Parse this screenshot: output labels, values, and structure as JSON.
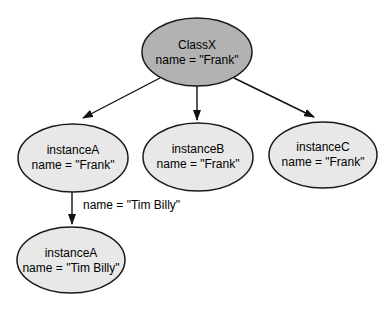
{
  "diagram": {
    "title_hint": "class-instance object diagram",
    "nodes": {
      "class_x": {
        "title": "ClassX",
        "attribute": "name = \"Frank\""
      },
      "instance_a": {
        "title": "instanceA",
        "attribute": "name = \"Frank\""
      },
      "instance_b": {
        "title": "instanceB",
        "attribute": "name = \"Frank\""
      },
      "instance_c": {
        "title": "instanceC",
        "attribute": "name = \"Frank\""
      },
      "instance_a_renamed": {
        "title": "instanceA",
        "attribute": "name = \"Tim Billy\""
      }
    },
    "edge_label": "name = \"Tim Billy\"",
    "colors": {
      "class_node_fill": "#b2b2b2",
      "instance_node_fill": "#e8e8e8",
      "node_stroke": "#1a1a1a",
      "arrow": "#111111",
      "text": "#000000",
      "background": "#ffffff"
    }
  }
}
